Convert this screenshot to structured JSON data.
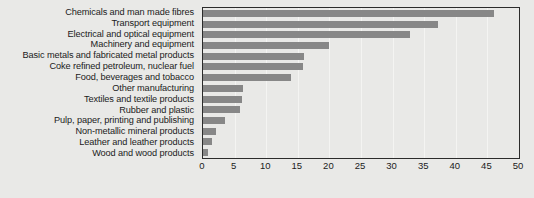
{
  "chart_data": {
    "type": "bar",
    "orientation": "horizontal",
    "title": "",
    "subtitle": "",
    "xlabel": "",
    "ylabel": "",
    "xlim": [
      0,
      50
    ],
    "xticks": [
      0,
      5,
      10,
      15,
      20,
      25,
      30,
      35,
      40,
      45,
      50
    ],
    "grid": true,
    "legend": null,
    "bar_color": "#878787",
    "background_color": "#e9e9e7",
    "border_color": "#2b2b2b",
    "gridline_color": "#f4f4f2",
    "categories": [
      "Chemicals and man made fibres",
      "Transport equipment",
      "Electrical and optical equipment",
      "Machinery and equipment",
      "Basic metals and fabricated metal products",
      "Coke refined petroleum, nuclear fuel",
      "Food, beverages and tobacco",
      "Other manufacturing",
      "Textiles and textile products",
      "Rubber and plastic",
      "Pulp, paper, printing and publishing",
      "Non-metallic mineral products",
      "Leather and leather products",
      "Wood and wood products"
    ],
    "values": [
      46.1,
      37.2,
      32.8,
      19.9,
      16.0,
      15.8,
      14.0,
      6.3,
      6.1,
      5.8,
      3.5,
      2.0,
      1.5,
      0.8
    ]
  }
}
